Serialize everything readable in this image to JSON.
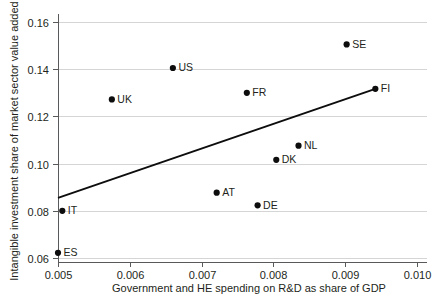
{
  "chart_data": {
    "type": "scatter",
    "title": "",
    "xlabel": "Government and HE spending on R&D as share of GDP",
    "ylabel": "Intangible investment share of market sector value added",
    "xlim": [
      0.005,
      0.01
    ],
    "ylim": [
      0.06,
      0.165
    ],
    "xticks": [
      "0.005",
      "0.006",
      "0.007",
      "0.008",
      "0.009",
      "0.010"
    ],
    "yticks": [
      "0.06",
      "0.08",
      "0.10",
      "0.12",
      "0.14",
      "0.16"
    ],
    "xtick_values": [
      0.005,
      0.006,
      0.007,
      0.008,
      0.009,
      0.01
    ],
    "ytick_values": [
      0.06,
      0.08,
      0.1,
      0.12,
      0.14,
      0.16
    ],
    "grid": "horizontal",
    "legend": "none",
    "marker_color": "#0d0d0d",
    "trendline_color": "#0d0d0d",
    "gridline_color": "#d5d5d5",
    "axis_color": "#58595b",
    "points": [
      {
        "label": "ES",
        "x": 0.005,
        "y": 0.0622,
        "label_side": "right"
      },
      {
        "label": "IT",
        "x": 0.00506,
        "y": 0.08,
        "label_side": "right"
      },
      {
        "label": "UK",
        "x": 0.00575,
        "y": 0.1272,
        "label_side": "right"
      },
      {
        "label": "US",
        "x": 0.0066,
        "y": 0.1405,
        "label_side": "right"
      },
      {
        "label": "AT",
        "x": 0.00721,
        "y": 0.0877,
        "label_side": "right"
      },
      {
        "label": "FR",
        "x": 0.00763,
        "y": 0.13,
        "label_side": "right"
      },
      {
        "label": "DE",
        "x": 0.00778,
        "y": 0.0823,
        "label_side": "right"
      },
      {
        "label": "DK",
        "x": 0.00804,
        "y": 0.1016,
        "label_side": "right"
      },
      {
        "label": "NL",
        "x": 0.00835,
        "y": 0.1076,
        "label_side": "right"
      },
      {
        "label": "SE",
        "x": 0.00902,
        "y": 0.1505,
        "label_side": "right"
      },
      {
        "label": "FI",
        "x": 0.00942,
        "y": 0.1317,
        "label_side": "right"
      }
    ],
    "trendline": {
      "x0": 0.005,
      "y0": 0.0855,
      "x1": 0.00942,
      "y1": 0.1317
    }
  }
}
